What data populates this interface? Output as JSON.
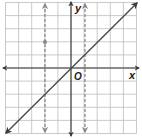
{
  "diagram": {
    "type": "coordinate-graph",
    "grid": {
      "x_min": -5,
      "x_max": 5,
      "y_min": -5,
      "y_max": 5,
      "origin_px": [
        71,
        68
      ],
      "unit_px": 13.1,
      "color": "#b8b8b8"
    },
    "axes": {
      "x_label": "x",
      "y_label": "y",
      "origin_label": "O",
      "color": "#333333"
    },
    "lines": [
      {
        "id": "solid-line",
        "equation": "y = x",
        "style": "solid",
        "color": "#4a4a4a",
        "from": [
          -5,
          -5
        ],
        "to": [
          5,
          5
        ]
      },
      {
        "id": "dashed-line-left",
        "equation": "x = -2",
        "style": "dashed",
        "color": "#888888"
      },
      {
        "id": "dashed-line-right",
        "equation": "x = 1",
        "style": "dashed",
        "color": "#888888"
      }
    ],
    "points": [
      {
        "x": -2,
        "y": 2,
        "color": "#888888"
      }
    ]
  }
}
